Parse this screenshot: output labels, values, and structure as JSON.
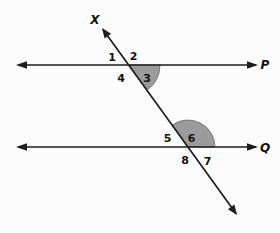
{
  "figure": {
    "colors": {
      "background": "#fcfcfc",
      "line": "#1d1d1d",
      "shade": "#9b9b9b",
      "shade_edge": "#6f6f6f",
      "text": "#111111"
    },
    "line_labels": {
      "transversal": "X",
      "top_line": "P",
      "bottom_line": "Q"
    },
    "angles": {
      "a1": "1",
      "a2": "2",
      "a3": "3",
      "a4": "4",
      "a5": "5",
      "a6": "6",
      "a7": "7",
      "a8": "8"
    }
  }
}
